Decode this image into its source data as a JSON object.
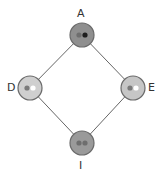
{
  "diagram": {
    "type": "lattice",
    "nodes": [
      {
        "id": "A",
        "label": "A",
        "x": 82,
        "y": 35,
        "fill": "#8f8f8f",
        "dots": [
          "#6e6e6e",
          "#1e1e1e"
        ]
      },
      {
        "id": "D",
        "label": "D",
        "x": 30,
        "y": 88,
        "fill": "#cfcfcf",
        "dots": [
          "#7a7a7a",
          "#ffffff"
        ]
      },
      {
        "id": "E",
        "label": "E",
        "x": 133,
        "y": 88,
        "fill": "#c6c6c6",
        "dots": [
          "#7a7a7a",
          "#ffffff"
        ]
      },
      {
        "id": "I",
        "label": "I",
        "x": 82,
        "y": 143,
        "fill": "#9a9a9a",
        "dots": [
          "#6e6e6e",
          "#6e6e6e"
        ]
      }
    ],
    "edges": [
      {
        "from": "A",
        "to": "D"
      },
      {
        "from": "A",
        "to": "E"
      },
      {
        "from": "D",
        "to": "I"
      },
      {
        "from": "E",
        "to": "I"
      }
    ],
    "colors": {
      "edge": "#666666",
      "stroke": "#6a6a6a",
      "label": "#333333"
    }
  }
}
